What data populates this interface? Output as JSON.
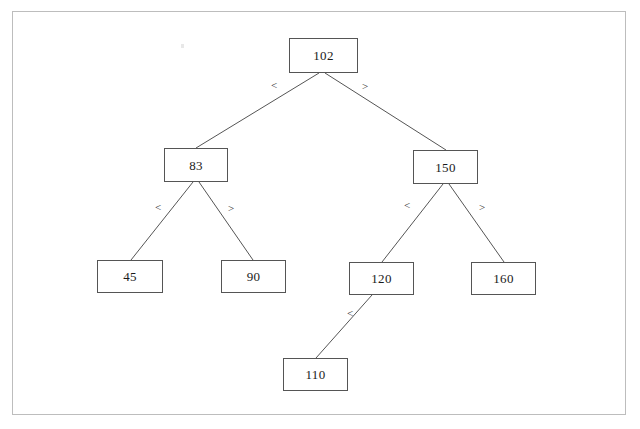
{
  "page": {
    "width": 640,
    "height": 429,
    "background_color": "#ffffff",
    "border_color": "#bdbdbd"
  },
  "diagram": {
    "type": "binary-search-tree",
    "node_border_color": "#555555",
    "node_fill_color": "#ffffff",
    "edge_color": "#555555",
    "nodes": [
      {
        "id": "n102",
        "label": "102",
        "x": 289,
        "y": 38,
        "w": 69,
        "h": 35
      },
      {
        "id": "n83",
        "label": "83",
        "x": 164,
        "y": 148,
        "w": 64,
        "h": 34
      },
      {
        "id": "n150",
        "label": "150",
        "x": 413,
        "y": 150,
        "w": 65,
        "h": 34
      },
      {
        "id": "n45",
        "label": "45",
        "x": 97,
        "y": 260,
        "w": 66,
        "h": 33
      },
      {
        "id": "n90",
        "label": "90",
        "x": 221,
        "y": 260,
        "w": 65,
        "h": 33
      },
      {
        "id": "n120",
        "label": "120",
        "x": 349,
        "y": 262,
        "w": 65,
        "h": 33
      },
      {
        "id": "n160",
        "label": "160",
        "x": 471,
        "y": 262,
        "w": 65,
        "h": 33
      },
      {
        "id": "n110",
        "label": "110",
        "x": 283,
        "y": 358,
        "w": 65,
        "h": 33
      }
    ],
    "edges": [
      {
        "from": "n102",
        "to": "n83",
        "label": "<",
        "label_x": 271,
        "label_y": 80,
        "x1": 319,
        "y1": 73,
        "x2": 196,
        "y2": 148
      },
      {
        "from": "n102",
        "to": "n150",
        "label": ">",
        "label_x": 362,
        "label_y": 81,
        "x1": 325,
        "y1": 73,
        "x2": 446,
        "y2": 150
      },
      {
        "from": "n83",
        "to": "n45",
        "label": "<",
        "label_x": 155,
        "label_y": 202,
        "x1": 193,
        "y1": 182,
        "x2": 131,
        "y2": 260
      },
      {
        "from": "n83",
        "to": "n90",
        "label": ">",
        "label_x": 228,
        "label_y": 203,
        "x1": 199,
        "y1": 182,
        "x2": 253,
        "y2": 260
      },
      {
        "from": "n150",
        "to": "n120",
        "label": "<",
        "label_x": 404,
        "label_y": 200,
        "x1": 443,
        "y1": 184,
        "x2": 382,
        "y2": 262
      },
      {
        "from": "n150",
        "to": "n160",
        "label": ">",
        "label_x": 479,
        "label_y": 202,
        "x1": 449,
        "y1": 184,
        "x2": 504,
        "y2": 262
      },
      {
        "from": "n120",
        "to": "n110",
        "label": "<",
        "label_x": 347,
        "label_y": 308,
        "x1": 372,
        "y1": 295,
        "x2": 316,
        "y2": 358
      }
    ]
  }
}
